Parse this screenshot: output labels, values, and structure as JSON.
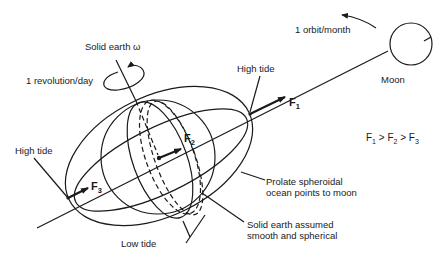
{
  "labels": {
    "solid_earth": "Solid earth ω",
    "revolution": "1 revolution/day",
    "orbit": "1 orbit/month",
    "moon": "Moon",
    "high_tide_right": "High tide",
    "high_tide_left": "High tide",
    "low_tide": "Low tide",
    "prolate_line1": "Prolate spheroidal",
    "prolate_line2": "ocean points to moon",
    "solid_line1": "Solid earth assumed",
    "solid_line2": "smooth and spherical"
  },
  "forces": {
    "f1": {
      "letter": "F",
      "sub": "1"
    },
    "f2": {
      "letter": "F",
      "sub": "2"
    },
    "f3": {
      "letter": "F",
      "sub": "3"
    }
  },
  "inequality": {
    "a": "F",
    "a_sub": "1",
    "gt1": " > ",
    "b": "F",
    "b_sub": "2",
    "gt2": " > ",
    "c": "F",
    "c_sub": "3"
  },
  "colors": {
    "stroke": "#1a1a1a",
    "background": "#ffffff"
  }
}
